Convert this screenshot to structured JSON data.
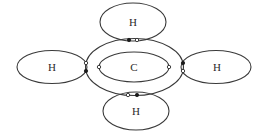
{
  "diagram": {
    "central_atom": {
      "label": "C"
    },
    "atoms": [
      {
        "id": "top",
        "label": "H"
      },
      {
        "id": "left",
        "label": "H"
      },
      {
        "id": "right",
        "label": "H"
      },
      {
        "id": "bottom",
        "label": "H"
      }
    ],
    "legend": {
      "filled_dot": "electron from H",
      "open_dot": "electron from C"
    },
    "colors": {
      "line": "#3a3a3a",
      "filled": "#1a1a1a",
      "background": "#ffffff"
    }
  }
}
